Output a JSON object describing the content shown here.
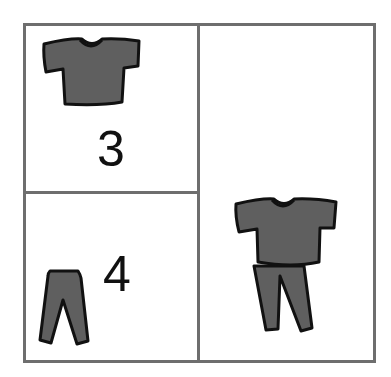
{
  "panels": {
    "top_left": {
      "item": "shirt-icon",
      "count": "3"
    },
    "bottom_left": {
      "item": "pants-icon",
      "count": "4"
    },
    "right": {
      "item": "outfit-icon",
      "description": "shirt and pants combined"
    }
  },
  "colors": {
    "border": "#6e6e6e",
    "garment_fill": "#5f5f5f",
    "garment_outline": "#111111"
  }
}
